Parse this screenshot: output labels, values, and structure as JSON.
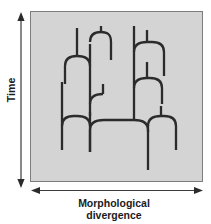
{
  "figure": {
    "type": "phylogenetic-tree-diagram",
    "axes": {
      "y": {
        "label": "Time",
        "arrow": "double-headed-vertical",
        "direction": "vertical"
      },
      "x": {
        "label_line1": "Morphological",
        "label_line2": "divergence",
        "arrow": "double-headed-horizontal",
        "direction": "horizontal"
      }
    },
    "colors": {
      "panel_fill": "#d4d4d4",
      "panel_border": "#7d7d7d",
      "branch_stroke": "#2b2b2b",
      "axis_stroke": "#3a3a3a",
      "text": "#1b1b1b",
      "background": "#ffffff"
    },
    "panel": {
      "x": 30,
      "y": 11,
      "width": 173,
      "height": 171
    },
    "tree": {
      "stroke_width": 2.3,
      "root_x": 148,
      "root_bottom_y": 170,
      "branch_count": 16,
      "description": "Cladogram with rounded bifurcating branches showing lineage splitting through time with morphological spread"
    }
  }
}
